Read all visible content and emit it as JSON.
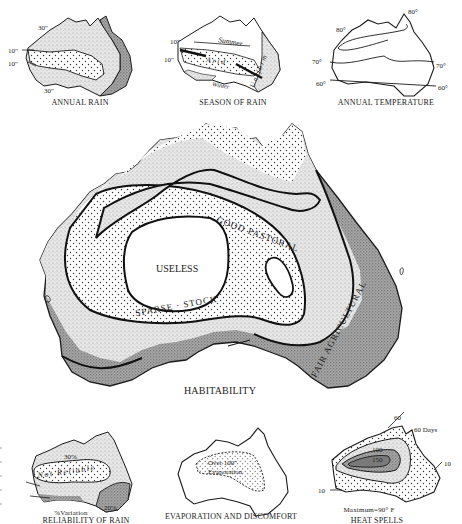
{
  "figure": {
    "colors": {
      "ink": "#1a1a1a",
      "light_stipple": "#e4e4e4",
      "dark_stipple": "#9a9a9a",
      "paper": "#ffffff"
    }
  },
  "annual_rain": {
    "caption": "ANNUAL RAIN",
    "labels": {
      "isohyet_30_top": "30\"",
      "isohyet_10_a": "10\"",
      "isohyet_10_b": "10\"",
      "isohyet_30_bottom": "30\""
    }
  },
  "season_of_rain": {
    "caption": "SEASON OF RAIN",
    "labels": {
      "isohyet_10_a": "10\"",
      "isohyet_10_b": "10\"",
      "summer": "Summer",
      "arid": "A r i d",
      "uniform": "U n i f o r m",
      "winter": "Winter"
    }
  },
  "annual_temperature": {
    "caption": "ANNUAL TEMPERATURE",
    "labels": {
      "t80_west": "80°",
      "t80_east": "80°",
      "t70_west": "70°",
      "t70_east": "70°",
      "t60_west": "60°",
      "t60_east": "60°"
    }
  },
  "habitability": {
    "caption": "HABITABILITY",
    "zones": {
      "useless": "USELESS",
      "good_pastoral": "GOOD  PASTORAL",
      "sparse_stock": "SPARSE · STOCK",
      "fair_agricultural": "FAIR  AGRICULTURAL"
    }
  },
  "reliability_of_rain": {
    "caption": "RELIABILITY OF RAIN",
    "subcaption": "%Variation",
    "labels": {
      "p30": "30%",
      "not_reliable": "Not Reliable",
      "p20": "20%"
    }
  },
  "evaporation": {
    "caption": "EVAPORATION AND DISCOMFORT",
    "labels": {
      "line1": "Over 100\"",
      "line2": "Evaporation"
    }
  },
  "heat_spells": {
    "caption": "HEAT SPELLS",
    "subcaption": "Maximum=90° F",
    "labels": {
      "d60_a": "60",
      "d60_days": "60 Days",
      "d100": "100",
      "d150": "150",
      "d10_east": "10",
      "d10_west": "10"
    }
  }
}
